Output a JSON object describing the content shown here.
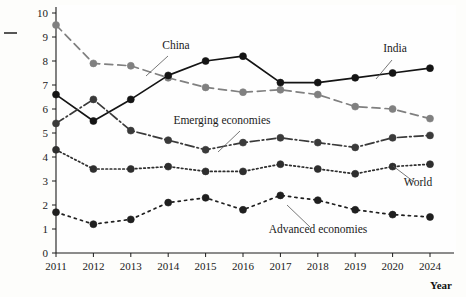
{
  "chart_data": {
    "type": "line",
    "title": "",
    "xlabel": "Year",
    "ylabel": "",
    "categories": [
      "2011",
      "2012",
      "2013",
      "2014",
      "2015",
      "2016",
      "2017",
      "2018",
      "2019",
      "2020",
      "2024"
    ],
    "ylim": [
      0,
      10
    ],
    "yticks": [
      0,
      1,
      2,
      3,
      4,
      5,
      6,
      7,
      8,
      9,
      10
    ],
    "grid": false,
    "legend_position": "inline-annotations",
    "series": [
      {
        "name": "China",
        "label": "China",
        "color": "#808080",
        "line_style": "dashed",
        "values": [
          9.5,
          7.9,
          7.8,
          7.3,
          6.9,
          6.7,
          6.8,
          6.6,
          6.1,
          6.0,
          5.6
        ]
      },
      {
        "name": "India",
        "label": "India",
        "color": "#141414",
        "line_style": "solid",
        "values": [
          6.6,
          5.5,
          6.4,
          7.4,
          8.0,
          8.2,
          7.1,
          7.1,
          7.3,
          7.5,
          7.7
        ]
      },
      {
        "name": "Emerging economies",
        "label": "Emerging economies",
        "color": "#3a3a3a",
        "line_style": "dashdot",
        "values": [
          5.4,
          6.4,
          5.1,
          4.7,
          4.3,
          4.6,
          4.8,
          4.6,
          4.4,
          4.8,
          4.9
        ]
      },
      {
        "name": "World",
        "label": "World",
        "color": "#2e2e2e",
        "line_style": "dotted",
        "values": [
          4.3,
          3.5,
          3.5,
          3.6,
          3.4,
          3.4,
          3.7,
          3.5,
          3.3,
          3.6,
          3.7
        ]
      },
      {
        "name": "Advanced economies",
        "label": "Advanced economies",
        "color": "#1f1f1f",
        "line_style": "dotted-wide",
        "values": [
          1.7,
          1.2,
          1.4,
          2.1,
          2.3,
          1.8,
          2.4,
          2.2,
          1.8,
          1.6,
          1.5
        ]
      }
    ],
    "annotations": [
      {
        "text": "China",
        "x": 176,
        "y": 49
      },
      {
        "text": "India",
        "x": 395,
        "y": 52
      },
      {
        "text": "Emerging economies",
        "x": 222,
        "y": 124
      },
      {
        "text": "World",
        "x": 418,
        "y": 186
      },
      {
        "text": "Advanced economies",
        "x": 318,
        "y": 233
      }
    ]
  }
}
